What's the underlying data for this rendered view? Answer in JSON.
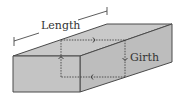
{
  "diagram": {
    "labels": {
      "length": "Length",
      "girth": "Girth"
    },
    "colors": {
      "face_top": "#c9c9c9",
      "face_front": "#c2c2c2",
      "face_side": "#bdbdbd",
      "edge": "#4a4a4a",
      "dashed": "#333333",
      "text": "#333333"
    }
  }
}
